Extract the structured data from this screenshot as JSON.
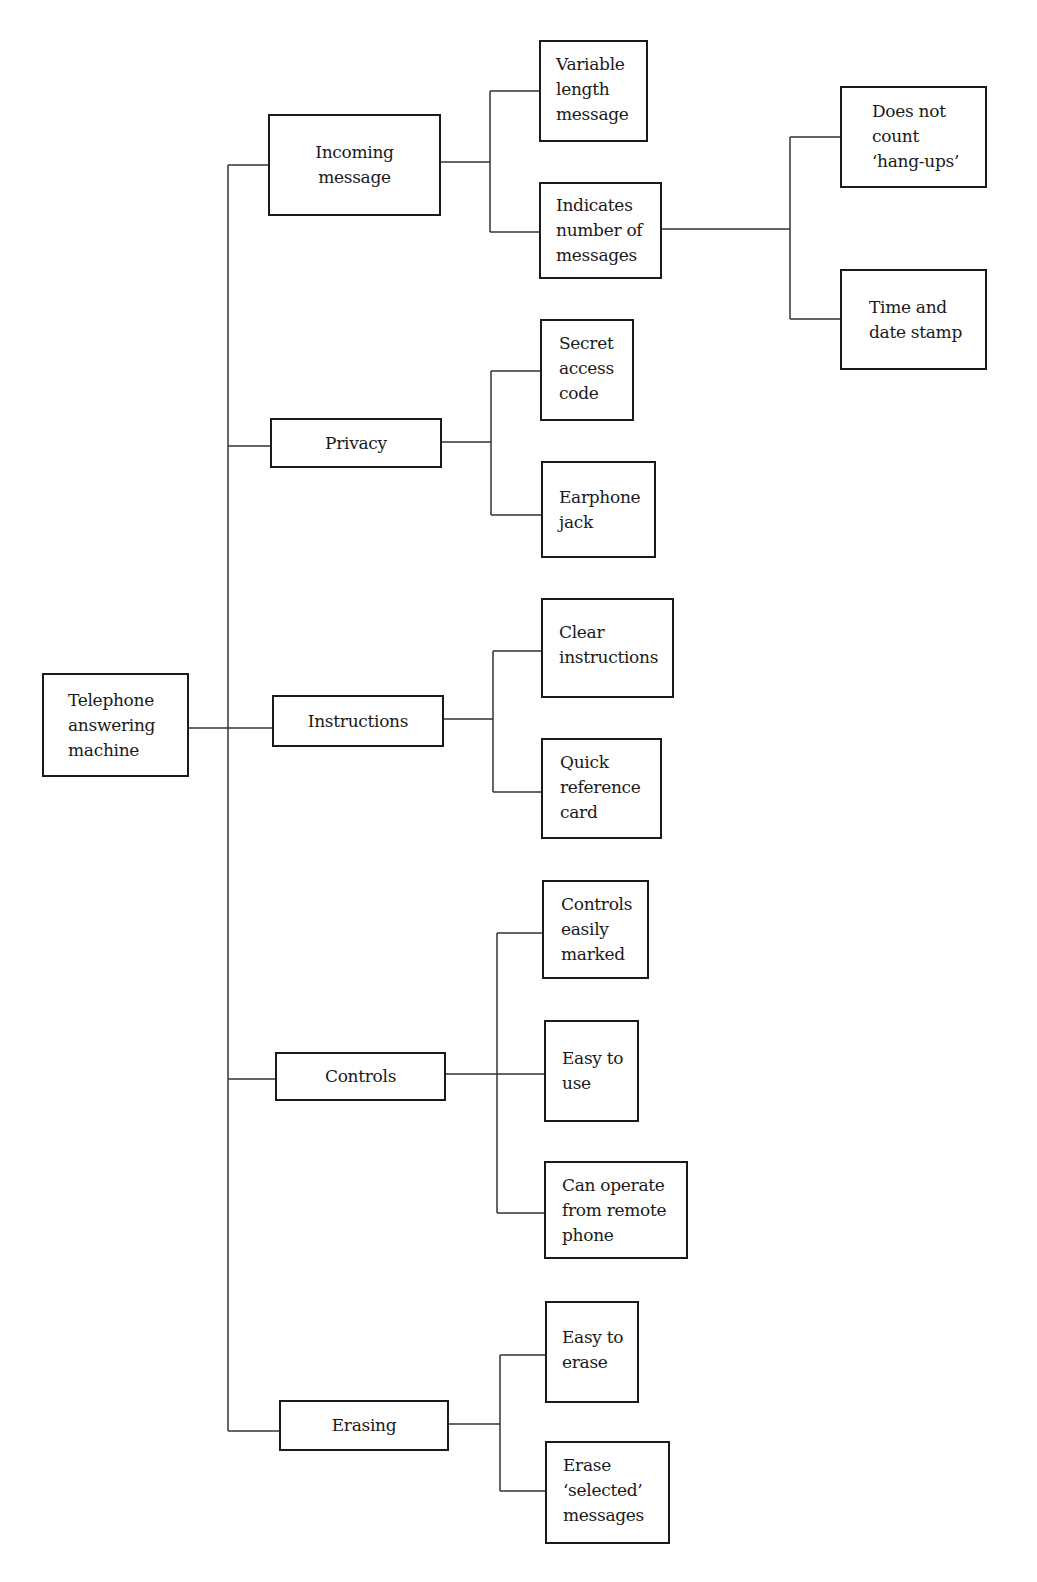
{
  "diagram": {
    "type": "tree",
    "orientation": "left-to-right",
    "root": {
      "id": "root",
      "label_lines": [
        "Telephone",
        "answering",
        "machine"
      ]
    },
    "categories": [
      {
        "id": "incoming",
        "label_lines": [
          "Incoming",
          "message"
        ],
        "children": [
          {
            "id": "variable",
            "label_lines": [
              "Variable",
              "length",
              "message"
            ]
          },
          {
            "id": "indicates",
            "label_lines": [
              "Indicates",
              "number of",
              "messages"
            ],
            "children": [
              {
                "id": "hangups",
                "label_lines": [
                  "Does not",
                  "count",
                  "‘hang-ups’"
                ]
              },
              {
                "id": "timestamp",
                "label_lines": [
                  "Time and",
                  "date stamp"
                ]
              }
            ]
          }
        ]
      },
      {
        "id": "privacy",
        "label_lines": [
          "Privacy"
        ],
        "children": [
          {
            "id": "secret",
            "label_lines": [
              "Secret",
              "access",
              "code"
            ]
          },
          {
            "id": "earphone",
            "label_lines": [
              "Earphone",
              "jack"
            ]
          }
        ]
      },
      {
        "id": "instructions",
        "label_lines": [
          "Instructions"
        ],
        "children": [
          {
            "id": "clear",
            "label_lines": [
              "Clear",
              "instructions"
            ]
          },
          {
            "id": "quickref",
            "label_lines": [
              "Quick",
              "reference",
              "card"
            ]
          }
        ]
      },
      {
        "id": "controls",
        "label_lines": [
          "Controls"
        ],
        "children": [
          {
            "id": "marked",
            "label_lines": [
              "Controls",
              "easily",
              "marked"
            ]
          },
          {
            "id": "easyuse",
            "label_lines": [
              "Easy to",
              "use"
            ]
          },
          {
            "id": "remote",
            "label_lines": [
              "Can operate",
              "from remote",
              "phone"
            ]
          }
        ]
      },
      {
        "id": "erasing",
        "label_lines": [
          "Erasing"
        ],
        "children": [
          {
            "id": "easyerase",
            "label_lines": [
              "Easy to",
              "erase"
            ]
          },
          {
            "id": "selected",
            "label_lines": [
              "Erase",
              "‘selected’",
              "messages"
            ]
          }
        ]
      }
    ],
    "colors": {
      "line": "#333333",
      "border": "#1a1a1a",
      "background": "#ffffff",
      "text": "#1a1a1a"
    }
  }
}
